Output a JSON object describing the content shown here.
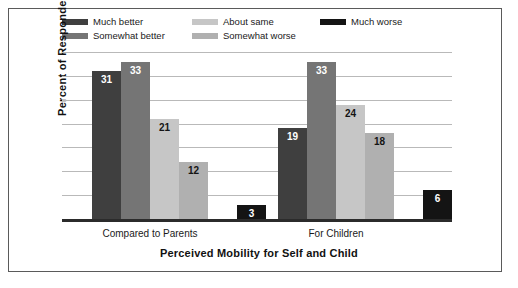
{
  "chart_data": {
    "type": "bar",
    "title": "Perceived Mobility for Self and Child",
    "xlabel": "Perceived Mobility for Self and Child",
    "ylabel": "Percent of Respondents",
    "categories": [
      "Compared to Parents",
      "For Children"
    ],
    "ylim": [
      0,
      35
    ],
    "yticks": [
      0,
      5,
      10,
      15,
      20,
      25,
      30,
      35
    ],
    "grid": true,
    "legend_position": "top",
    "series": [
      {
        "name": "Much better",
        "color": "#3f3f3f",
        "label_color": "#ffffff",
        "values": [
          31,
          19
        ]
      },
      {
        "name": "Somewhat better",
        "color": "#757575",
        "label_color": "#ffffff",
        "values": [
          33,
          33
        ]
      },
      {
        "name": "About same",
        "color": "#c6c6c6",
        "label_color": "#141414",
        "values": [
          21,
          24
        ]
      },
      {
        "name": "Somewhat worse",
        "color": "#b0b0b0",
        "label_color": "#141414",
        "values": [
          12,
          18
        ]
      },
      {
        "name": "Much worse",
        "color": "#141414",
        "label_color": "#ffffff",
        "values": [
          3,
          6
        ]
      }
    ]
  },
  "legend": {
    "items": [
      {
        "label": "Much better",
        "swatch": "#3f3f3f",
        "col": 0,
        "row": 0
      },
      {
        "label": "Somewhat better",
        "swatch": "#757575",
        "col": 0,
        "row": 1
      },
      {
        "label": "About same",
        "swatch": "#c6c6c6",
        "col": 1,
        "row": 0
      },
      {
        "label": "Somewhat worse",
        "swatch": "#b0b0b0",
        "col": 1,
        "row": 1
      },
      {
        "label": "Much worse",
        "swatch": "#141414",
        "col": 2,
        "row": 0
      }
    ]
  }
}
